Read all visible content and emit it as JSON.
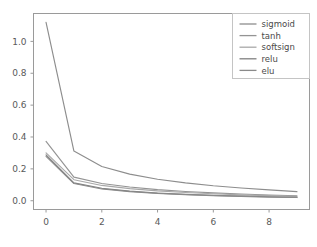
{
  "chart_data": {
    "type": "line",
    "title": "",
    "xlabel": "",
    "ylabel": "",
    "xlim": [
      -0.45,
      9.45
    ],
    "ylim": [
      -0.055,
      1.175
    ],
    "xticks": [
      0,
      2,
      4,
      6,
      8
    ],
    "xticklabels": [
      "0",
      "2",
      "4",
      "6",
      "8"
    ],
    "yticks": [
      0.0,
      0.2,
      0.4,
      0.6,
      0.8,
      1.0
    ],
    "yticklabels": [
      "0.0",
      "0.2",
      "0.4",
      "0.6",
      "0.8",
      "1.0"
    ],
    "grid": false,
    "legend_position": "upper right",
    "x": [
      0,
      1,
      2,
      3,
      4,
      5,
      6,
      7,
      8,
      9
    ],
    "series": [
      {
        "name": "sigmoid",
        "color": "#8d8d8d",
        "values": [
          1.12,
          0.312,
          0.215,
          0.167,
          0.135,
          0.112,
          0.094,
          0.08,
          0.068,
          0.057
        ]
      },
      {
        "name": "tanh",
        "color": "#949494",
        "values": [
          0.372,
          0.148,
          0.108,
          0.086,
          0.07,
          0.058,
          0.049,
          0.042,
          0.036,
          0.031
        ]
      },
      {
        "name": "softsign",
        "color": "#a8a8a8",
        "values": [
          0.3,
          0.132,
          0.096,
          0.076,
          0.062,
          0.052,
          0.044,
          0.037,
          0.032,
          0.027
        ]
      },
      {
        "name": "relu",
        "color": "#808080",
        "values": [
          0.288,
          0.112,
          0.078,
          0.06,
          0.048,
          0.04,
          0.034,
          0.029,
          0.025,
          0.021
        ]
      },
      {
        "name": "elu",
        "color": "#8a8a8a",
        "values": [
          0.278,
          0.108,
          0.074,
          0.057,
          0.046,
          0.038,
          0.032,
          0.027,
          0.023,
          0.02
        ]
      }
    ],
    "legend_entries": [
      "sigmoid",
      "tanh",
      "softsign",
      "relu",
      "elu"
    ],
    "axis_color": "#9a9a9a",
    "background_color": "#ffffff"
  },
  "legend": {
    "items": [
      {
        "label": "sigmoid"
      },
      {
        "label": "tanh"
      },
      {
        "label": "softsign"
      },
      {
        "label": "relu"
      },
      {
        "label": "elu"
      }
    ]
  },
  "axes": {
    "x_tick_labels": [
      "0",
      "2",
      "4",
      "6",
      "8"
    ],
    "y_tick_labels": [
      "0.0",
      "0.2",
      "0.4",
      "0.6",
      "0.8",
      "1.0"
    ]
  }
}
